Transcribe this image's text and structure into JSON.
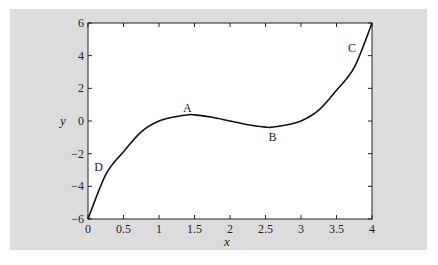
{
  "chart_data": {
    "type": "line",
    "title": "",
    "xlabel": "x",
    "ylabel": "y",
    "xlim": [
      0,
      4
    ],
    "ylim": [
      -6,
      6
    ],
    "grid": false,
    "x_ticks": [
      "0",
      "0.5",
      "1",
      "1.5",
      "2",
      "2.5",
      "3",
      "3.5",
      "4"
    ],
    "y_ticks": [
      "-6",
      "-4",
      "-2",
      "0",
      "2",
      "4",
      "6"
    ],
    "series": [
      {
        "name": "y = (x-1)(x-2)(x-3)",
        "x": [
          0,
          0.25,
          0.5,
          0.75,
          1.0,
          1.25,
          1.42,
          1.5,
          1.75,
          2.0,
          2.25,
          2.5,
          2.58,
          2.75,
          3.0,
          3.25,
          3.5,
          3.75,
          4.0
        ],
        "values": [
          -6,
          -3.28,
          -1.88,
          -0.66,
          0,
          0.28,
          0.385,
          0.375,
          0.23,
          0,
          -0.23,
          -0.375,
          -0.385,
          -0.28,
          0,
          0.66,
          1.88,
          3.28,
          6
        ]
      }
    ],
    "annotations": [
      {
        "text": "A",
        "x": 1.4,
        "y": 0.8
      },
      {
        "text": "B",
        "x": 2.6,
        "y": -1.0
      },
      {
        "text": "C",
        "x": 3.72,
        "y": 4.5
      },
      {
        "text": "D",
        "x": 0.15,
        "y": -2.8
      }
    ]
  },
  "labels": {
    "xlabel": "x",
    "ylabel": "y",
    "A": "A",
    "B": "B",
    "C": "C",
    "D": "D"
  }
}
